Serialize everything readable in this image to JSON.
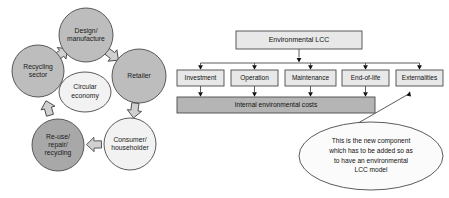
{
  "figure": {
    "width": 449,
    "height": 198,
    "background": "#ffffff"
  },
  "colors": {
    "circle_dark": "#a8a8a8",
    "circle_mid": "#bdbdbd",
    "circle_light": "#f2f2f2",
    "box_fill": "#e8e8e8",
    "bar_fill": "#b5b5b5",
    "callout_fill": "#fbfbfb",
    "stroke": "#4a4a4a",
    "arrow_fill": "#d0d0d0",
    "text": "#111111"
  },
  "left_diagram": {
    "name": "circular-economy-cycle",
    "center_node": {
      "id": "circular-economy",
      "label_lines": [
        "Circular",
        "economy"
      ],
      "fill": "circle_light",
      "cx": 85,
      "cy": 92,
      "rx": 26,
      "ry": 20
    },
    "nodes": [
      {
        "id": "design-manufacture",
        "label_lines": [
          "Design/",
          "manufacture"
        ],
        "fill": "circle_mid",
        "cx": 86,
        "cy": 35,
        "r": 27
      },
      {
        "id": "retailer",
        "label_lines": [
          "Retailer"
        ],
        "fill": "circle_mid",
        "cx": 139,
        "cy": 76,
        "r": 27
      },
      {
        "id": "consumer-householder",
        "label_lines": [
          "Consumer/",
          "householder"
        ],
        "fill": "circle_light",
        "cx": 130,
        "cy": 144,
        "r": 26
      },
      {
        "id": "re-use-repair-recycling",
        "label_lines": [
          "Re-use/",
          "repair/",
          "recycling"
        ],
        "fill": "circle_dark",
        "cx": 58,
        "cy": 145,
        "r": 26
      },
      {
        "id": "recycling-sector",
        "label_lines": [
          "Recycling",
          "sector"
        ],
        "fill": "circle_mid",
        "cx": 38,
        "cy": 71,
        "r": 26
      }
    ],
    "arrows": [
      {
        "id": "arrow-design-to-retailer",
        "from": "design-manufacture",
        "to": "retailer"
      },
      {
        "id": "arrow-retailer-to-consumer",
        "from": "retailer",
        "to": "consumer-householder"
      },
      {
        "id": "arrow-consumer-to-reuse",
        "from": "consumer-householder",
        "to": "re-use-repair-recycling"
      },
      {
        "id": "arrow-reuse-to-recycling-sector",
        "from": "re-use-repair-recycling",
        "to": "recycling-sector"
      },
      {
        "id": "arrow-recycling-sector-to-design",
        "from": "recycling-sector",
        "to": "design-manufacture"
      }
    ]
  },
  "right_diagram": {
    "name": "environmental-lcc-tree",
    "root": {
      "id": "environmental-lcc",
      "label": "Environmental LCC",
      "x": 236,
      "y": 31,
      "w": 126,
      "h": 18
    },
    "components": [
      {
        "id": "investment",
        "label": "Investment",
        "x": 177,
        "y": 70,
        "w": 47,
        "h": 16
      },
      {
        "id": "operation",
        "label": "Operation",
        "x": 231,
        "y": 70,
        "w": 47,
        "h": 16
      },
      {
        "id": "maintenance",
        "label": "Maintenance",
        "x": 285,
        "y": 70,
        "w": 51,
        "h": 16
      },
      {
        "id": "end-of-life",
        "label": "End-of-life",
        "x": 342,
        "y": 70,
        "w": 47,
        "h": 16
      },
      {
        "id": "externalities",
        "label": "Externalities",
        "x": 396,
        "y": 70,
        "w": 47,
        "h": 16
      }
    ],
    "internal_costs_bar": {
      "id": "internal-environmental-costs",
      "label": "Internal environmental costs",
      "x": 177,
      "y": 97,
      "w": 198,
      "h": 16
    },
    "callout": {
      "id": "new-component-callout",
      "lines": [
        "This is the new component",
        "which has to be added so as",
        "to have an environmental",
        "LCC model"
      ],
      "cx": 371,
      "cy": 156,
      "rx": 72,
      "ry": 34,
      "pointer_target_x": 410,
      "pointer_target_y": 88
    }
  }
}
